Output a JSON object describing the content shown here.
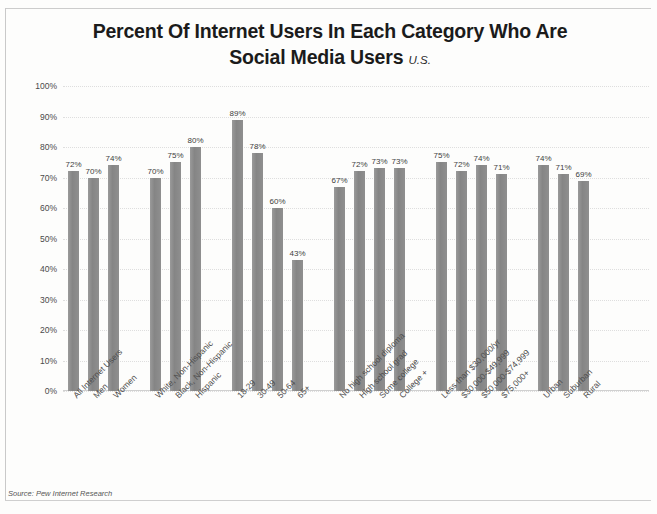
{
  "chart_data": {
    "type": "bar",
    "title": "Percent Of Internet Users In Each Category Who Are Social Media Users",
    "title_line1": "Percent Of Internet Users In Each Category Who Are",
    "title_line2": "Social Media Users",
    "subtitle": "U.S.",
    "xlabel": "",
    "ylabel": "",
    "ylim": [
      0,
      100
    ],
    "grid": true,
    "legend": "none",
    "source": "Source: Pew Internet Research",
    "ytick_labels": [
      "0%",
      "10%",
      "20%",
      "30%",
      "40%",
      "50%",
      "60%",
      "70%",
      "80%",
      "90%",
      "100%"
    ],
    "ytick_values": [
      0,
      10,
      20,
      30,
      40,
      50,
      60,
      70,
      80,
      90,
      100
    ],
    "bar_color": "#8d8d8d",
    "categories": [
      "All Internet Users",
      "Men",
      "Women",
      "White, Non-Hispanic",
      "Black, Non-Hispanic",
      "Hispanic",
      "18-29",
      "30-49",
      "50-64",
      "65+",
      "No high school diploma",
      "High school grad",
      "Some college",
      "College +",
      "Less than $30,000/yr",
      "$30,000-$49,999",
      "$50,000-$74,999",
      "$75,000+",
      "Urban",
      "Suburban",
      "Rural"
    ],
    "values": [
      72,
      70,
      74,
      70,
      75,
      80,
      89,
      78,
      60,
      43,
      67,
      72,
      73,
      73,
      75,
      72,
      74,
      71,
      74,
      71,
      69
    ],
    "value_labels": [
      "72%",
      "70%",
      "74%",
      "70%",
      "75%",
      "80%",
      "89%",
      "78%",
      "60%",
      "43%",
      "67%",
      "72%",
      "73%",
      "73%",
      "75%",
      "72%",
      "74%",
      "71%",
      "74%",
      "71%",
      "69%"
    ],
    "groups": [
      {
        "name": "Total / Gender",
        "categories": [
          "All Internet Users",
          "Men",
          "Women"
        ],
        "values": [
          72,
          70,
          74
        ]
      },
      {
        "name": "Race / Ethnicity",
        "categories": [
          "White, Non-Hispanic",
          "Black, Non-Hispanic",
          "Hispanic"
        ],
        "values": [
          70,
          75,
          80
        ]
      },
      {
        "name": "Age",
        "categories": [
          "18-29",
          "30-49",
          "50-64",
          "65+"
        ],
        "values": [
          89,
          78,
          60,
          43
        ]
      },
      {
        "name": "Education",
        "categories": [
          "No high school diploma",
          "High school grad",
          "Some college",
          "College +"
        ],
        "values": [
          67,
          72,
          73,
          73
        ]
      },
      {
        "name": "Household Income",
        "categories": [
          "Less than $30,000/yr",
          "$30,000-$49,999",
          "$50,000-$74,999",
          "$75,000+"
        ],
        "values": [
          75,
          72,
          74,
          71
        ]
      },
      {
        "name": "Community Type",
        "categories": [
          "Urban",
          "Suburban",
          "Rural"
        ],
        "values": [
          74,
          71,
          69
        ]
      }
    ]
  }
}
